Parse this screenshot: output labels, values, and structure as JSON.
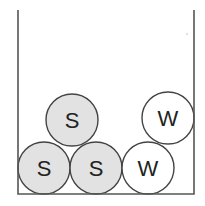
{
  "diagram": {
    "colors": {
      "wall": "#555555",
      "outline": "#444444",
      "shaded_fill": "#e2e2e2",
      "white_fill": "#ffffff"
    },
    "container": {
      "left_x": 18,
      "right_x": 194,
      "top_y": 10,
      "bottom_y": 194
    },
    "circles": [
      {
        "label": "S",
        "cx": 44,
        "cy": 168,
        "r": 26,
        "shaded": true
      },
      {
        "label": "S",
        "cx": 96,
        "cy": 168,
        "r": 26,
        "shaded": true
      },
      {
        "label": "S",
        "cx": 72,
        "cy": 120,
        "r": 26,
        "shaded": true
      },
      {
        "label": "W",
        "cx": 148,
        "cy": 168,
        "r": 26,
        "shaded": false
      },
      {
        "label": "W",
        "cx": 168,
        "cy": 118,
        "r": 26,
        "shaded": false
      }
    ]
  }
}
